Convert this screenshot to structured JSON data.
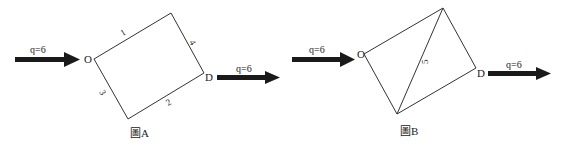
{
  "figures": [
    {
      "id": "A",
      "caption": "圖A",
      "inflow": {
        "label": "q=6"
      },
      "outflow": {
        "label": "q=6"
      },
      "nodes": {
        "origin": "O",
        "destination": "D"
      },
      "links": [
        {
          "id": "1",
          "label": "1"
        },
        {
          "id": "2",
          "label": "2"
        },
        {
          "id": "3",
          "label": "3"
        },
        {
          "id": "4",
          "label": "4"
        }
      ]
    },
    {
      "id": "B",
      "caption": "圖B",
      "inflow": {
        "label": "q=6"
      },
      "outflow": {
        "label": "q=6"
      },
      "nodes": {
        "origin": "O",
        "destination": "D"
      },
      "links": [
        {
          "id": "5",
          "label": "5"
        }
      ]
    }
  ],
  "colors": {
    "line": "#333333",
    "arrow": "#1a1a1a",
    "text": "#222222"
  }
}
